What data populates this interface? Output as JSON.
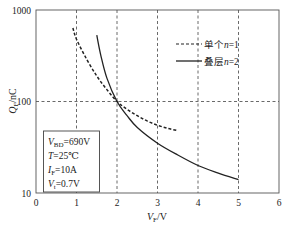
{
  "chart_data": {
    "type": "line",
    "title": "",
    "xlabel": "V_F/V",
    "ylabel": "Q_F/nC",
    "xlim": [
      0,
      6
    ],
    "ylim": [
      10,
      1000
    ],
    "yscale": "log",
    "xticks": [
      "0",
      "1",
      "2",
      "3",
      "4",
      "5",
      "6"
    ],
    "yticks": [
      "10",
      "100",
      "1000"
    ],
    "grid": "dashed at x=1..5 and y=100",
    "legend_position": "upper right",
    "series": [
      {
        "name": "单个n=1",
        "style": "dashed",
        "x": [
          0.91,
          1.0,
          1.25,
          1.5,
          1.75,
          2.0,
          2.25,
          2.5,
          2.75,
          3.0,
          3.25,
          3.5
        ],
        "y": [
          635,
          480,
          290,
          190,
          135,
          100,
          82,
          70,
          61,
          55,
          51,
          48
        ]
      },
      {
        "name": "叠层n=2",
        "style": "solid",
        "x": [
          1.5,
          1.6,
          1.75,
          2.0,
          2.25,
          2.5,
          3.0,
          3.5,
          4.0,
          4.5,
          5.0
        ],
        "y": [
          530,
          320,
          180,
          100,
          70,
          52,
          35,
          26,
          20,
          16.5,
          14
        ]
      }
    ],
    "annotation": [
      "V_BD=690V",
      "T=25℃",
      "I_F=10A",
      "V_t=0.7V"
    ]
  }
}
